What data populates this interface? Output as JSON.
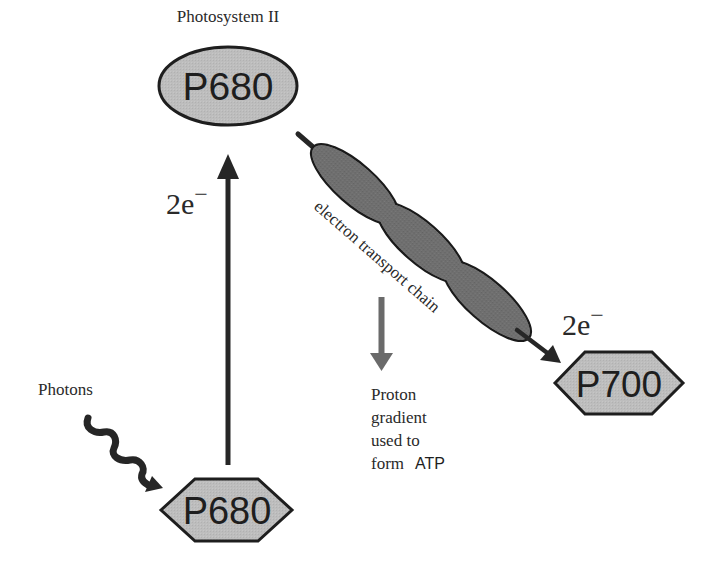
{
  "diagram": {
    "type": "flow",
    "colors": {
      "node_fill": "#bcbcbc",
      "etc_fill": "#6e6e6e",
      "arrow_dark": "#262626",
      "arrow_grey": "#6a6a6a",
      "stroke": "#1e1e1e"
    },
    "labels": {
      "photosystem": "Photosystem II",
      "photons": "Photons",
      "electrons_up": "2e",
      "electrons_up_sup": "−",
      "electrons_out": "2e",
      "electrons_out_sup": "−",
      "etc": "electron transport chain",
      "proton_lines": [
        "Proton",
        "gradient",
        "used to",
        "form "
      ],
      "atp": "ATP"
    },
    "nodes": [
      {
        "id": "p680-excited",
        "label": "P680",
        "shape": "ellipse"
      },
      {
        "id": "p680-ground",
        "label": "P680",
        "shape": "hexagon"
      },
      {
        "id": "p700",
        "label": "P700",
        "shape": "hexagon"
      },
      {
        "id": "etc",
        "label": "electron transport chain",
        "shape": "chain-of-3-ellipses"
      }
    ],
    "edges": [
      {
        "from": "photons",
        "to": "p680-ground",
        "style": "wavy"
      },
      {
        "from": "p680-ground",
        "to": "p680-excited",
        "label": "2e−"
      },
      {
        "from": "p680-excited",
        "to": "etc"
      },
      {
        "from": "etc",
        "to": "p700",
        "label": "2e−"
      },
      {
        "from": "etc",
        "to": "proton-gradient",
        "style": "grey"
      }
    ]
  }
}
